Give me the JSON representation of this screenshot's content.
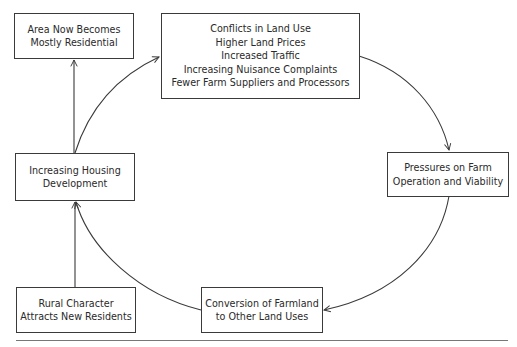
{
  "diagram": {
    "type": "cycle",
    "nodes": {
      "area_residential": {
        "lines": [
          "Area Now Becomes",
          "Mostly Residential"
        ]
      },
      "conflicts": {
        "lines": [
          "Conflicts in Land Use",
          "Higher Land Prices",
          "Increased Traffic",
          "Increasing Nuisance Complaints",
          "Fewer Farm Suppliers and Processors"
        ]
      },
      "pressures": {
        "lines": [
          "Pressures on Farm",
          "Operation and Viability"
        ]
      },
      "conversion": {
        "lines": [
          "Conversion of Farmland",
          "to Other Land Uses"
        ]
      },
      "housing": {
        "lines": [
          "Increasing Housing",
          "Development"
        ]
      },
      "rural_character": {
        "lines": [
          "Rural Character",
          "Attracts New Residents"
        ]
      }
    },
    "edges": [
      {
        "from": "housing",
        "to": "conflicts",
        "style": "curved-arrow"
      },
      {
        "from": "conflicts",
        "to": "pressures",
        "style": "curved-arrow"
      },
      {
        "from": "pressures",
        "to": "conversion",
        "style": "curved-arrow"
      },
      {
        "from": "conversion",
        "to": "housing",
        "style": "curved-arrow"
      },
      {
        "from": "housing",
        "to": "area_residential",
        "style": "straight-arrow"
      },
      {
        "from": "rural_character",
        "to": "housing",
        "style": "straight-arrow"
      }
    ],
    "colors": {
      "stroke": "#3a3a3a",
      "text": "#2a2a2a",
      "background": "#ffffff",
      "rule": "#777777"
    }
  }
}
